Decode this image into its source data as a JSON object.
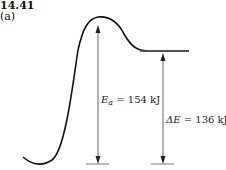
{
  "figure": {
    "number": "14.41",
    "part": "(a)"
  },
  "annotations": {
    "activation_energy": {
      "symbol": "E",
      "subscript": "a",
      "equals": "= 154 kJ"
    },
    "energy_change": {
      "symbol": "ΔE",
      "equals": "= 136 kJ"
    }
  },
  "colors": {
    "curve": "#111111",
    "arrow": "#555555",
    "baseline": "#666666"
  }
}
